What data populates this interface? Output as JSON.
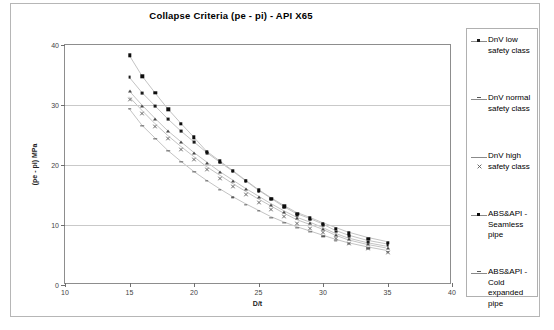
{
  "chart_data": {
    "type": "scatter",
    "title": "Collapse Criteria (pe - pi) - API X65",
    "xlabel": "D/t",
    "ylabel": "(pe - pi) MPa",
    "xlim": [
      10,
      40
    ],
    "ylim": [
      0,
      40
    ],
    "xticks": [
      10,
      15,
      20,
      25,
      30,
      35,
      40
    ],
    "yticks": [
      0,
      10,
      20,
      30,
      40
    ],
    "grid": "horizontal",
    "legend_position": "right",
    "x": [
      15,
      16,
      17,
      18,
      19,
      20,
      21,
      22,
      23,
      24,
      25,
      26,
      27,
      28,
      29,
      30,
      31,
      32,
      33.5,
      35
    ],
    "series": [
      {
        "name": "DnV low safety class",
        "marker": "square",
        "values": [
          34.6,
          32.0,
          29.8,
          27.6,
          25.6,
          23.8,
          22.0,
          20.4,
          18.9,
          17.3,
          15.7,
          14.3,
          12.9,
          11.7,
          10.9,
          10.0,
          8.9,
          8.1,
          7.2,
          6.6
        ]
      },
      {
        "name": "DnV normal safety class",
        "marker": "triangle",
        "values": [
          32.3,
          29.9,
          27.7,
          25.6,
          23.8,
          22.0,
          20.4,
          18.8,
          17.4,
          16.0,
          14.7,
          13.4,
          12.2,
          11.1,
          10.3,
          9.4,
          8.4,
          7.6,
          6.8,
          6.2
        ]
      },
      {
        "name": "DnV high safety class",
        "marker": "cross",
        "values": [
          31.3,
          29.0,
          26.8,
          24.8,
          23.0,
          21.3,
          19.6,
          18.2,
          16.8,
          15.5,
          14.2,
          13.0,
          11.8,
          10.7,
          9.9,
          9.1,
          8.1,
          7.3,
          6.5,
          5.9
        ]
      },
      {
        "name": "ABS&API - Seamless pipe",
        "marker": "square-bold",
        "values": [
          38.3,
          34.8,
          32.0,
          29.3,
          26.9,
          24.6,
          22.2,
          20.6,
          19.0,
          17.4,
          15.8,
          14.4,
          13.1,
          11.9,
          11.1,
          10.2,
          9.4,
          8.6,
          7.7,
          7.0
        ]
      },
      {
        "name": "ABS&API - Cold expanded pipe",
        "marker": "dash",
        "values": [
          29.3,
          26.5,
          24.4,
          22.3,
          20.5,
          18.8,
          17.3,
          15.9,
          14.6,
          13.4,
          12.3,
          11.2,
          10.3,
          9.5,
          8.8,
          8.1,
          7.4,
          6.8,
          6.1,
          5.5
        ]
      }
    ]
  },
  "legend": {
    "items": [
      {
        "label": "DnV low safety class",
        "marker": "square"
      },
      {
        "label": "DnV normal safety class",
        "marker": "dash"
      },
      {
        "label": "DnV high safety class",
        "marker": "cross"
      },
      {
        "label": "ABS&API - Seamless pipe",
        "marker": "square-bold"
      },
      {
        "label": "ABS&API - Cold expanded pipe",
        "marker": "dash-small"
      }
    ]
  },
  "colors": {
    "plot_border": "#8d8d8d",
    "gridline": "#c9c9c9",
    "marker": "#111111",
    "series_line": "#bcbcbc",
    "frame": "#b6b6b6",
    "text": "#000000"
  }
}
